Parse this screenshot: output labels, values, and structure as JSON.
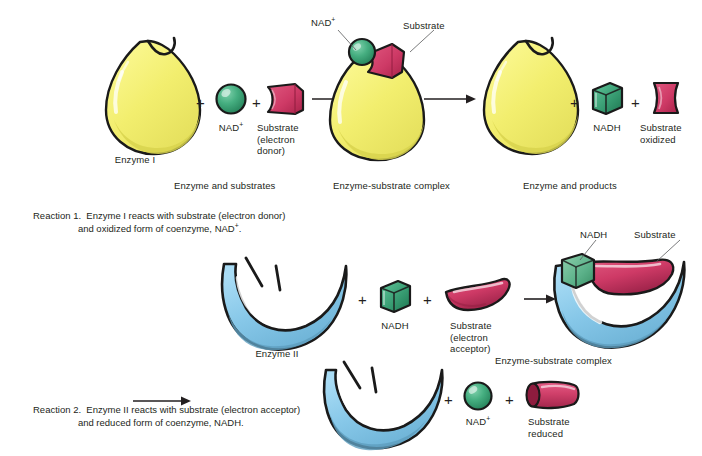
{
  "figure": {
    "type": "biochemistry-diagram",
    "colors": {
      "enzyme_i": "#F2EE6E",
      "enzyme_i_shadow": "#D8D34E",
      "enzyme_ii": "#86C7E8",
      "enzyme_ii_shadow": "#5E9DBE",
      "coenzyme_green": "#3FA87A",
      "coenzyme_green_dark": "#217C55",
      "substrate_crimson": "#CE3A66",
      "substrate_crimson_dark": "#9B2248",
      "outline": "#1a1a1a",
      "text": "#231f20",
      "leader": "#58595b"
    }
  },
  "row1": {
    "panel1": {
      "caption": "Enzyme and substrates",
      "enzyme_label": "Enzyme I",
      "coenzyme_label": "NAD",
      "coenzyme_charge": "+",
      "substrate_label_line1": "Substrate",
      "substrate_label_line2": "(electron",
      "substrate_label_line3": "donor)",
      "plus1": "+",
      "plus2": "+"
    },
    "panel2": {
      "caption": "Enzyme-substrate complex",
      "callout_coenzyme": "NAD",
      "callout_coenzyme_charge": "+",
      "callout_substrate": "Substrate"
    },
    "panel3": {
      "caption": "Enzyme and products",
      "coenzyme_label": "NADH",
      "substrate_label_line1": "Substrate",
      "substrate_label_line2": "oxidized",
      "plus1": "+",
      "plus2": "+"
    }
  },
  "reaction1": {
    "number": "Reaction 1.",
    "line1": "Enzyme I reacts with substrate (electron donor)",
    "line2": "and oxidized form of coenzyme, NAD",
    "line2_charge": "+",
    "line2_end": "."
  },
  "row2": {
    "panel1": {
      "enzyme_label": "Enzyme II",
      "coenzyme_label": "NADH",
      "substrate_label_line1": "Substrate",
      "substrate_label_line2": "(electron",
      "substrate_label_line3": "acceptor)",
      "plus1": "+",
      "plus2": "+"
    },
    "panel2": {
      "caption": "Enzyme-substrate complex",
      "callout_coenzyme": "NADH",
      "callout_substrate": "Substrate"
    }
  },
  "row3": {
    "coenzyme_label": "NAD",
    "coenzyme_charge": "+",
    "substrate_label_line1": "Substrate",
    "substrate_label_line2": "reduced",
    "plus1": "+",
    "plus2": "+"
  },
  "reaction2": {
    "number": "Reaction 2.",
    "line1": "Enzyme II reacts with substrate (electron acceptor)",
    "line2": "and reduced form of coenzyme, NADH."
  }
}
